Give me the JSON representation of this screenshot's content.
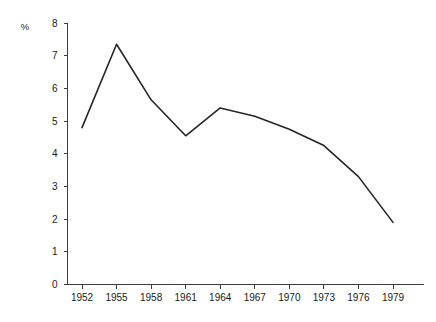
{
  "chart_data": {
    "type": "line",
    "title": "",
    "subtitle": "",
    "xlabel": "",
    "ylabel": "%",
    "ylim": [
      0,
      8
    ],
    "xlim": [
      1952,
      1979
    ],
    "grid": false,
    "legend": false,
    "legend_position": "none",
    "y_ticks": [
      "0",
      "1",
      "2",
      "3",
      "4",
      "5",
      "6",
      "7",
      "8"
    ],
    "y_tick_values": [
      0,
      1,
      2,
      3,
      4,
      5,
      6,
      7,
      8
    ],
    "categories": [
      "1952",
      "1955",
      "1958",
      "1961",
      "1964",
      "1967",
      "1970",
      "1973",
      "1976",
      "1979"
    ],
    "x": [
      1952,
      1955,
      1958,
      1961,
      1964,
      1967,
      1970,
      1973,
      1976,
      1979
    ],
    "values": [
      4.8,
      7.35,
      5.65,
      4.55,
      5.4,
      5.15,
      4.75,
      4.25,
      3.3,
      1.9
    ],
    "line_color": "#262626",
    "axis_color": "#3d3d3d",
    "background_color": "#ffffff"
  },
  "axes": {
    "y_unit_label": "%"
  }
}
